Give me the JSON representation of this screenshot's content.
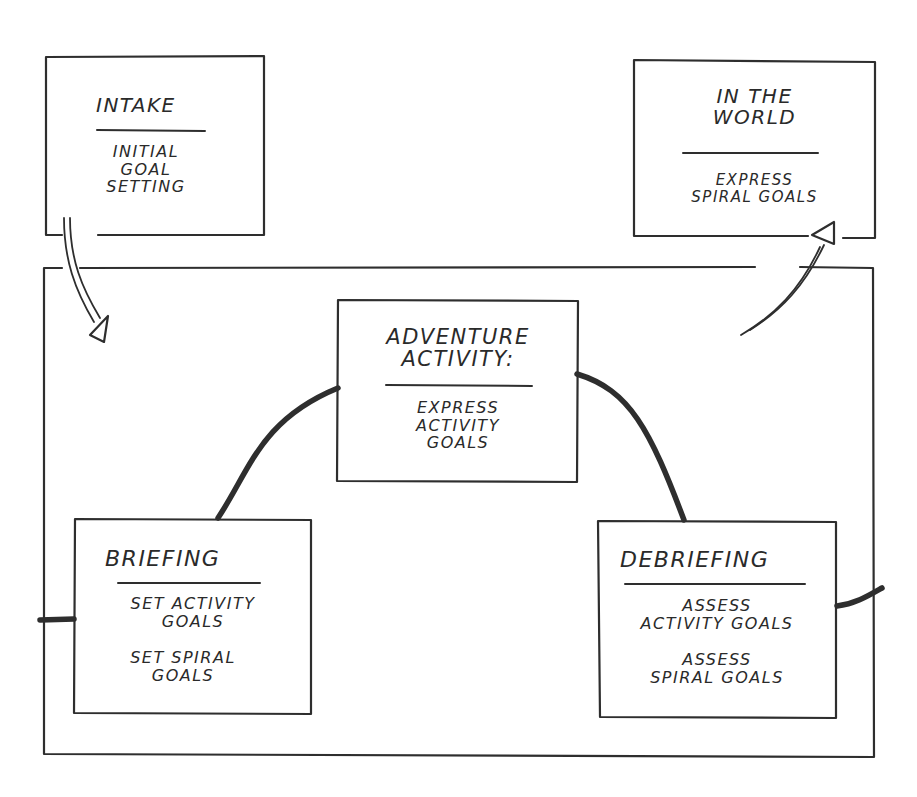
{
  "diagram": {
    "frame": {
      "name": "program-loop-frame"
    },
    "boxes": {
      "intake": {
        "title": "Intake",
        "lines": [
          "Initial",
          "Goal",
          "Setting"
        ]
      },
      "in_the_world": {
        "title_lines": [
          "In the",
          "World"
        ],
        "lines": [
          "Express",
          "Spiral Goals"
        ]
      },
      "adventure_activity": {
        "title_lines": [
          "Adventure",
          "Activity:"
        ],
        "lines": [
          "Express",
          "Activity",
          "Goals"
        ]
      },
      "briefing": {
        "title": "Briefing",
        "groups": [
          [
            "Set Activity",
            "Goals"
          ],
          [
            "Set Spiral",
            "Goals"
          ]
        ]
      },
      "debriefing": {
        "title": "Debriefing",
        "groups": [
          [
            "Assess",
            "Activity Goals"
          ],
          [
            "Assess",
            "Spiral Goals"
          ]
        ]
      }
    },
    "arrows": [
      {
        "from": "intake",
        "to": "program-loop-frame",
        "style": "double-line hollow-head"
      },
      {
        "from": "program-loop-frame",
        "to": "in_the_world",
        "style": "double-line hollow-head"
      }
    ],
    "connectors": [
      {
        "from": "frame-left-edge",
        "to": "briefing"
      },
      {
        "from": "briefing",
        "to": "adventure_activity"
      },
      {
        "from": "adventure_activity",
        "to": "debriefing"
      },
      {
        "from": "debriefing",
        "to": "frame-right-edge"
      }
    ],
    "colors": {
      "ink": "#2a2a2a",
      "paper": "#ffffff"
    }
  }
}
